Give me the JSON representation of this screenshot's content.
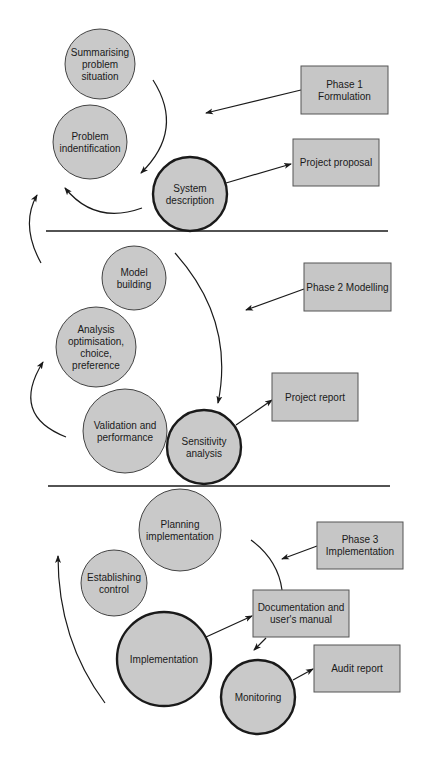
{
  "colors": {
    "node_fill": "#c9c9c9",
    "box_fill": "#c6c6c6",
    "stroke": "#1a1a1a",
    "background": "#ffffff"
  },
  "phases": [
    {
      "id": "phase1",
      "label_lines": [
        "Phase 1",
        "Formulation"
      ],
      "box": {
        "x": 301,
        "y": 66,
        "w": 87,
        "h": 48
      },
      "stages": [
        {
          "id": "summarising",
          "lines": [
            "Summarising",
            "problem",
            "situation"
          ],
          "cx": 100,
          "cy": 64,
          "r": 35,
          "emphasis": false
        },
        {
          "id": "problem-identification",
          "lines": [
            "Problem",
            "indentification"
          ],
          "cx": 90,
          "cy": 142,
          "r": 37,
          "emphasis": false
        },
        {
          "id": "system-description",
          "lines": [
            "System",
            "description"
          ],
          "cx": 190,
          "cy": 194,
          "r": 37,
          "emphasis": true
        }
      ],
      "output": {
        "lines": [
          "Project proposal"
        ],
        "box": {
          "x": 293,
          "y": 139,
          "w": 86,
          "h": 47
        }
      },
      "divider_y": 231
    },
    {
      "id": "phase2",
      "label_lines": [
        "Phase 2 Modelling"
      ],
      "box": {
        "x": 304,
        "y": 263,
        "w": 87,
        "h": 48
      },
      "stages": [
        {
          "id": "model-building",
          "lines": [
            "Model",
            "building"
          ],
          "cx": 134,
          "cy": 278,
          "r": 32,
          "emphasis": false
        },
        {
          "id": "analysis",
          "lines": [
            "Analysis",
            "optimisation,",
            "choice,",
            "preference"
          ],
          "cx": 96,
          "cy": 347,
          "r": 40,
          "emphasis": false
        },
        {
          "id": "validation",
          "lines": [
            "Validation and",
            "performance"
          ],
          "cx": 125,
          "cy": 431,
          "r": 42,
          "emphasis": false
        },
        {
          "id": "sensitivity",
          "lines": [
            "Sensitivity",
            "analysis"
          ],
          "cx": 204,
          "cy": 447,
          "r": 37,
          "emphasis": true
        }
      ],
      "output": {
        "lines": [
          "Project report"
        ],
        "box": {
          "x": 272,
          "y": 373,
          "w": 86,
          "h": 48
        }
      },
      "divider_y": 486
    },
    {
      "id": "phase3",
      "label_lines": [
        "Phase 3",
        "Implementation"
      ],
      "box": {
        "x": 317,
        "y": 522,
        "w": 86,
        "h": 47
      },
      "stages": [
        {
          "id": "planning",
          "lines": [
            "Planning",
            "implementation"
          ],
          "cx": 180,
          "cy": 530,
          "r": 41,
          "emphasis": false
        },
        {
          "id": "establishing-control",
          "lines": [
            "Establishing",
            "control"
          ],
          "cx": 114,
          "cy": 583,
          "r": 33,
          "emphasis": false
        },
        {
          "id": "implementation",
          "lines": [
            "Implementation"
          ],
          "cx": 164,
          "cy": 659,
          "r": 47,
          "emphasis": true
        },
        {
          "id": "monitoring",
          "lines": [
            "Monitoring"
          ],
          "cx": 258,
          "cy": 697,
          "r": 37,
          "emphasis": true
        }
      ],
      "outputs": [
        {
          "id": "documentation",
          "lines": [
            "Documentation and",
            "user's manual"
          ],
          "box": {
            "x": 253,
            "y": 590,
            "w": 96,
            "h": 47
          }
        },
        {
          "id": "audit-report",
          "lines": [
            "Audit report"
          ],
          "box": {
            "x": 314,
            "y": 645,
            "w": 86,
            "h": 47
          }
        }
      ]
    }
  ],
  "dividers": [
    {
      "x1": 46,
      "x2": 388,
      "y": 231
    },
    {
      "x1": 48,
      "x2": 390,
      "y": 486
    }
  ],
  "arrows": {
    "straight": [
      {
        "from": "phase1-box",
        "x1": 301,
        "y1": 90,
        "x2": 206,
        "y2": 113
      },
      {
        "from": "system-description",
        "to": "project-proposal",
        "x1": 226,
        "y1": 183,
        "x2": 291,
        "y2": 164
      },
      {
        "from": "phase2-box",
        "x1": 304,
        "y1": 289,
        "x2": 246,
        "y2": 310
      },
      {
        "from": "sensitivity",
        "to": "project-report",
        "x1": 236,
        "y1": 425,
        "x2": 272,
        "y2": 400
      },
      {
        "from": "phase3-box",
        "x1": 317,
        "y1": 546,
        "x2": 282,
        "y2": 559
      },
      {
        "from": "implementation",
        "to": "documentation",
        "x1": 206,
        "y1": 637,
        "x2": 252,
        "y2": 616
      },
      {
        "from": "documentation",
        "x1": 266,
        "y1": 638,
        "x2": 254,
        "y2": 650
      },
      {
        "from": "monitoring",
        "to": "audit-report",
        "x1": 293,
        "y1": 680,
        "x2": 313,
        "y2": 669
      }
    ],
    "curved": [
      {
        "id": "summarising-to-problem",
        "d": "M153,80 Q185,130 141,173",
        "head": true
      },
      {
        "id": "system-to-problem",
        "d": "M142,208 Q95,225 65,188",
        "head": true
      },
      {
        "id": "phase2-to-phase1",
        "d": "M41,263 Q20,225 37,195",
        "head": true
      },
      {
        "id": "model-to-sensitivity",
        "d": "M175,253 Q235,320 218,403",
        "head": true
      },
      {
        "id": "validation-to-analysis",
        "d": "M66,437 Q10,415 43,362",
        "head": true
      },
      {
        "id": "planning-arc",
        "d": "M251,540 Q278,560 282,590",
        "head": false
      },
      {
        "id": "phase3-to-phase2",
        "d": "M105,703 Q58,640 58,556",
        "head": true
      }
    ]
  }
}
